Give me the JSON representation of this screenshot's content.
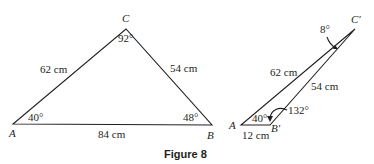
{
  "figure": {
    "caption": "Figure 8",
    "triangle_1": {
      "vertices": {
        "A": {
          "label": "A",
          "x": 13,
          "y": 124
        },
        "B": {
          "label": "B",
          "x": 212,
          "y": 125
        },
        "C": {
          "label": "C",
          "x": 126,
          "y": 29
        }
      },
      "sides": {
        "AC": "62 cm",
        "BC": "54 cm",
        "AB": "84 cm"
      },
      "angles": {
        "A": "40°",
        "B": "48°",
        "C": "92°"
      }
    },
    "triangle_2": {
      "vertices": {
        "A": {
          "label": "A",
          "x": 241,
          "y": 125
        },
        "B": {
          "label": "B′",
          "x": 270,
          "y": 125
        },
        "C": {
          "label": "C′",
          "x": 355,
          "y": 29
        }
      },
      "sides": {
        "AC": "62 cm",
        "BC": "54 cm",
        "AB": "12 cm"
      },
      "angles": {
        "A": "40°",
        "B": "132°",
        "C": "8°"
      }
    }
  }
}
